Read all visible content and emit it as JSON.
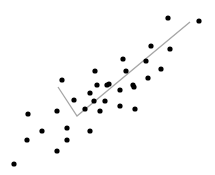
{
  "chart_data": {
    "type": "scatter",
    "title": "",
    "xlabel": "",
    "ylabel": "",
    "grid": false,
    "legend": null,
    "axes_visible": false,
    "pixel_space": {
      "width": 215,
      "height": 175
    },
    "point_color": "#000000",
    "point_radius": 2.6,
    "line_color": "#a6a6a6",
    "line_width": 1.3,
    "points": [
      {
        "x": 14,
        "y": 164
      },
      {
        "x": 27,
        "y": 140
      },
      {
        "x": 28,
        "y": 114
      },
      {
        "x": 42,
        "y": 131
      },
      {
        "x": 57,
        "y": 151
      },
      {
        "x": 57,
        "y": 111
      },
      {
        "x": 62,
        "y": 80
      },
      {
        "x": 67,
        "y": 128
      },
      {
        "x": 67,
        "y": 140
      },
      {
        "x": 74,
        "y": 100
      },
      {
        "x": 85,
        "y": 109
      },
      {
        "x": 90,
        "y": 93
      },
      {
        "x": 90,
        "y": 131
      },
      {
        "x": 94,
        "y": 101
      },
      {
        "x": 95,
        "y": 71
      },
      {
        "x": 97,
        "y": 85
      },
      {
        "x": 100,
        "y": 111
      },
      {
        "x": 105,
        "y": 101
      },
      {
        "x": 107,
        "y": 85
      },
      {
        "x": 109,
        "y": 84
      },
      {
        "x": 120,
        "y": 90
      },
      {
        "x": 120,
        "y": 106
      },
      {
        "x": 123,
        "y": 59
      },
      {
        "x": 126,
        "y": 71
      },
      {
        "x": 133,
        "y": 85
      },
      {
        "x": 134,
        "y": 87
      },
      {
        "x": 135,
        "y": 109
      },
      {
        "x": 146,
        "y": 61
      },
      {
        "x": 148,
        "y": 78
      },
      {
        "x": 151,
        "y": 46
      },
      {
        "x": 161,
        "y": 69
      },
      {
        "x": 168,
        "y": 18
      },
      {
        "x": 170,
        "y": 49
      },
      {
        "x": 199,
        "y": 21
      }
    ],
    "line": [
      {
        "x": 58,
        "y": 87
      },
      {
        "x": 77,
        "y": 116
      },
      {
        "x": 190,
        "y": 22
      }
    ]
  }
}
